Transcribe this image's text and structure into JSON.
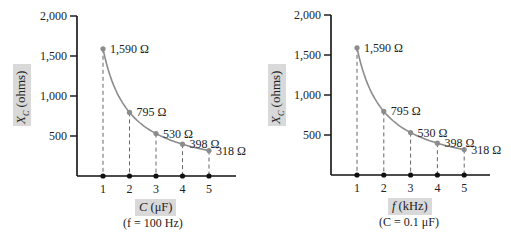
{
  "chart_data": [
    {
      "type": "line",
      "title": "",
      "xlabel": "C (μF)",
      "condition": "(f = 100 Hz)",
      "ylabel": "X_C (ohms)",
      "x": [
        1,
        2,
        3,
        4,
        5
      ],
      "values": [
        1590,
        795,
        530,
        398,
        318
      ],
      "point_labels": [
        "1,590 Ω",
        "795 Ω",
        "530 Ω",
        "398 Ω",
        "318 Ω"
      ],
      "yticks": [
        "500",
        "1,000",
        "1,500",
        "2,000"
      ],
      "xticks": [
        "1",
        "2",
        "3",
        "4",
        "5"
      ],
      "ylim": [
        0,
        2000
      ],
      "grid": false,
      "drop_lines": true,
      "curve_color": "#8c8c8c",
      "axis_color": "#111111"
    },
    {
      "type": "line",
      "title": "",
      "xlabel": "f (kHz)",
      "condition": "(C = 0.1 μF)",
      "ylabel": "X_C (ohms)",
      "x": [
        1,
        2,
        3,
        4,
        5
      ],
      "values": [
        1590,
        795,
        530,
        398,
        318
      ],
      "point_labels": [
        "1,590 Ω",
        "795 Ω",
        "530 Ω",
        "398 Ω",
        "318 Ω"
      ],
      "yticks": [
        "500",
        "1,000",
        "1,500",
        "2,000"
      ],
      "xticks": [
        "1",
        "2",
        "3",
        "4",
        "5"
      ],
      "ylim": [
        0,
        2000
      ],
      "grid": false,
      "drop_lines": true,
      "curve_color": "#8c8c8c",
      "axis_color": "#111111"
    }
  ],
  "left": {
    "ylabel_main": "X",
    "ylabel_sub": "C",
    "ylabel_rest": " (ohms)",
    "xlabel_var": "C",
    "xlabel_unit": " (μF)",
    "condition": "(f = 100 Hz)"
  },
  "right": {
    "ylabel_main": "X",
    "ylabel_sub": "C",
    "ylabel_rest": " (ohms)",
    "xlabel_var": "f",
    "xlabel_unit": " (kHz)",
    "condition": "(C = 0.1 μF)"
  }
}
